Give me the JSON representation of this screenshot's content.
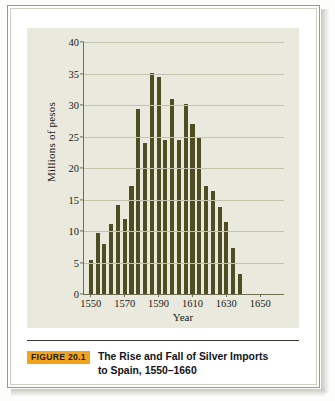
{
  "figure": {
    "badge": "FIGURE 20.1",
    "caption_line1": "The Rise and Fall of Silver Imports",
    "caption_line2": "to Spain, 1550–1660",
    "badge_color": "#f2a31c",
    "bar_color": "#4e4e22",
    "panel_color": "#e9e9dd",
    "grid_color": "#c3c3ae",
    "axis_color": "#6e6e55"
  },
  "chart_data": {
    "type": "bar",
    "title": "The Rise and Fall of Silver Imports to Spain, 1550–1660",
    "xlabel": "Year",
    "ylabel": "Millions of pesos",
    "ylim": [
      0,
      40
    ],
    "xlim": [
      1546,
      1664
    ],
    "yticks": [
      0,
      5,
      10,
      15,
      20,
      25,
      30,
      35,
      40
    ],
    "xticks": [
      1550,
      1570,
      1590,
      1610,
      1630,
      1650
    ],
    "grid": "horizontal",
    "legend": "none",
    "categories": [
      "1550",
      "1554",
      "1558",
      "1562",
      "1566",
      "1570",
      "1574",
      "1578",
      "1582",
      "1586",
      "1590",
      "1594",
      "1598",
      "1602",
      "1606",
      "1610",
      "1614",
      "1618",
      "1622",
      "1626",
      "1630",
      "1634",
      "1638",
      "1642",
      "1646",
      "1650",
      "1654",
      "1658"
    ],
    "values": [
      5.4,
      9.7,
      8.0,
      11.1,
      14.1,
      11.9,
      17.2,
      29.4,
      23.9,
      35.1,
      34.4,
      24.4,
      31.0,
      24.5,
      30.1,
      27.0,
      24.8,
      17.1,
      16.3,
      13.8,
      11.4,
      7.3,
      3.2,
      0,
      0,
      0,
      0,
      0
    ],
    "series": [
      {
        "name": "Silver imports to Spain",
        "unit": "millions of pesos",
        "points": [
          {
            "year": 1550,
            "value": 5.4
          },
          {
            "year": 1554,
            "value": 9.7
          },
          {
            "year": 1558,
            "value": 8.0
          },
          {
            "year": 1562,
            "value": 11.1
          },
          {
            "year": 1566,
            "value": 14.1
          },
          {
            "year": 1570,
            "value": 11.9
          },
          {
            "year": 1574,
            "value": 17.2
          },
          {
            "year": 1578,
            "value": 29.4
          },
          {
            "year": 1582,
            "value": 23.9
          },
          {
            "year": 1586,
            "value": 35.1
          },
          {
            "year": 1590,
            "value": 34.4
          },
          {
            "year": 1594,
            "value": 24.4
          },
          {
            "year": 1598,
            "value": 31.0
          },
          {
            "year": 1602,
            "value": 24.5
          },
          {
            "year": 1606,
            "value": 30.1
          },
          {
            "year": 1610,
            "value": 27.0
          },
          {
            "year": 1614,
            "value": 24.8
          },
          {
            "year": 1618,
            "value": 17.1
          },
          {
            "year": 1622,
            "value": 16.3
          },
          {
            "year": 1626,
            "value": 13.8
          },
          {
            "year": 1630,
            "value": 11.4
          },
          {
            "year": 1634,
            "value": 7.3
          },
          {
            "year": 1638,
            "value": 3.2
          }
        ]
      }
    ]
  }
}
